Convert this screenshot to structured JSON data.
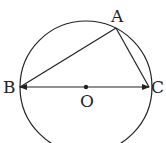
{
  "diagram": {
    "type": "circle-inscribed-triangle",
    "circle": {
      "center_label": "O",
      "cx": 86,
      "cy": 87,
      "r": 66
    },
    "points": {
      "A": {
        "label": "A",
        "x": 116,
        "y": 28
      },
      "B": {
        "label": "B",
        "x": 20,
        "y": 87
      },
      "C": {
        "label": "C",
        "x": 149,
        "y": 87
      },
      "O": {
        "label": "O",
        "x": 86,
        "y": 87
      }
    },
    "segments": [
      "AB",
      "AC",
      "BC (diameter, arrows at both ends)"
    ],
    "stroke_color": "#222222"
  }
}
